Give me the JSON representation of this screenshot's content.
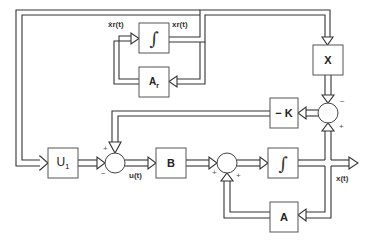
{
  "diagram": {
    "blocks": {
      "integrator_ref": "∫",
      "A_r": "Ar",
      "X": "X",
      "neg_K": "− K",
      "U1": "U1",
      "B": "B",
      "integrator_plant": "∫",
      "A": "A"
    },
    "signals": {
      "xr_dot": "ẋr(t)",
      "xr": "xr(t)",
      "u": "u(t)",
      "x": "x(t)"
    },
    "signs": {
      "sum_right_top": "−",
      "sum_right_bottom": "+",
      "sum_left_top": "+",
      "sum_left_left": "−",
      "sum_mid_left": "+",
      "sum_mid_bottom": "+"
    }
  }
}
